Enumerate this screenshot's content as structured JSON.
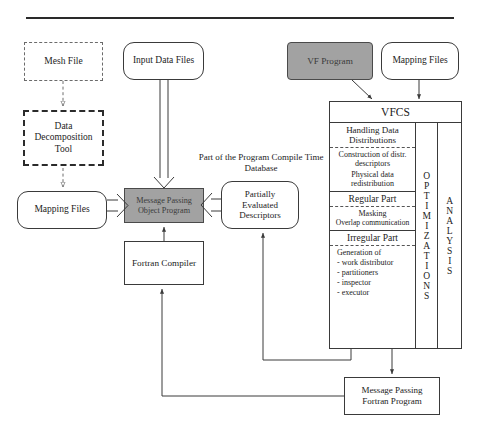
{
  "figure": {
    "top_rule": true,
    "nodes": {
      "mesh_file": "Mesh File",
      "data_decomposition_tool": [
        "Data",
        "Decomposition",
        "Tool"
      ],
      "mapping_files_left": "Mapping  Files",
      "input_data_files": "Input  Data  Files",
      "message_passing_object_program": [
        "Message  Passing",
        "Object  Program"
      ],
      "fortran_compiler": "Fortran  Compiler",
      "partially_evaluated_descriptors": [
        "Partially",
        "Evaluated",
        "Descriptors"
      ],
      "vf_program": "VF  Program",
      "mapping_files_right": "Mapping  Files",
      "message_passing_fortran_program": [
        "Message  Passing",
        "Fortran  Program"
      ]
    },
    "annotations": {
      "compile_time_database": [
        "Part of the Program",
        "Compile Time Database"
      ]
    },
    "vfcs": {
      "title": "VFCS",
      "groups": [
        {
          "header": [
            "Handling Data",
            "Distributions"
          ],
          "items": [
            {
              "align": "center",
              "lines": [
                "Construction of",
                "distr. descriptors"
              ]
            },
            {
              "align": "center",
              "lines": [
                "Physical data",
                "redistribution"
              ]
            }
          ]
        },
        {
          "header": [
            "Regular Part"
          ],
          "items": [
            {
              "align": "center",
              "lines": [
                "Masking"
              ]
            },
            {
              "align": "center",
              "lines": [
                "Overlap communication"
              ]
            }
          ]
        },
        {
          "header": [
            "Irregular Part"
          ],
          "items": [
            {
              "align": "left",
              "lines": [
                "Generation of"
              ]
            },
            {
              "align": "left",
              "lines": [
                "- work  distributor"
              ]
            },
            {
              "align": "left",
              "lines": [
                "- partitioners"
              ]
            },
            {
              "align": "left",
              "lines": [
                "- inspector"
              ]
            },
            {
              "align": "left",
              "lines": [
                "- executor"
              ]
            }
          ]
        }
      ],
      "optimizations_column": "OPTIMIZATIONS",
      "analysis_column": "ANALYSIS"
    },
    "colors": {
      "shaded_fill": "#a2a2a2",
      "line": "#3a3a3a",
      "dashed_thin": "#6b6b6b",
      "background": "#ffffff"
    }
  }
}
